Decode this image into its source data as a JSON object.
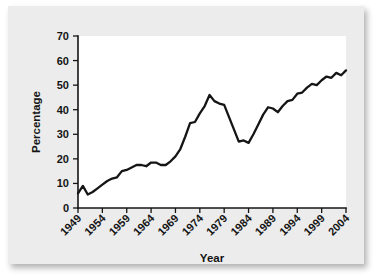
{
  "chart_data": {
    "type": "line",
    "title": "",
    "xlabel": "Year",
    "ylabel": "Percentage",
    "xlim": [
      1949,
      2004
    ],
    "ylim": [
      0,
      70
    ],
    "grid": false,
    "legend": null,
    "ytick_labels": [
      "0",
      "10",
      "20",
      "30",
      "40",
      "50",
      "60",
      "70"
    ],
    "ytick_values": [
      0,
      10,
      20,
      30,
      40,
      50,
      60,
      70
    ],
    "xtick_labels": [
      "1949",
      "1954",
      "1959",
      "1964",
      "1969",
      "1974",
      "1979",
      "1984",
      "1989",
      "1994",
      "1999",
      "2004"
    ],
    "xtick_values": [
      1949,
      1954,
      1959,
      1964,
      1969,
      1974,
      1979,
      1984,
      1989,
      1994,
      1999,
      2004
    ],
    "xtick_rotation": 45,
    "series": [
      {
        "name": "Percentage",
        "color": "#151515",
        "x": [
          1949,
          1950,
          1951,
          1952,
          1953,
          1954,
          1955,
          1956,
          1957,
          1958,
          1959,
          1960,
          1961,
          1962,
          1963,
          1964,
          1965,
          1966,
          1967,
          1968,
          1969,
          1970,
          1971,
          1972,
          1973,
          1974,
          1975,
          1976,
          1977,
          1978,
          1979,
          1980,
          1981,
          1982,
          1983,
          1984,
          1985,
          1986,
          1987,
          1988,
          1989,
          1990,
          1991,
          1992,
          1993,
          1994,
          1995,
          1996,
          1997,
          1998,
          1999,
          2000,
          2001,
          2002,
          2003,
          2004
        ],
        "y": [
          6.0,
          9.0,
          5.5,
          6.5,
          8.0,
          9.5,
          11.0,
          12.0,
          12.5,
          15.0,
          15.5,
          16.5,
          17.5,
          17.5,
          17.0,
          18.5,
          18.5,
          17.5,
          17.5,
          19.0,
          21.0,
          24.0,
          29.0,
          34.5,
          35.0,
          38.5,
          41.5,
          46.0,
          43.5,
          42.5,
          42.0,
          37.0,
          32.0,
          27.0,
          27.5,
          26.5,
          30.0,
          34.0,
          38.0,
          41.0,
          40.5,
          39.0,
          41.5,
          43.5,
          44.0,
          46.5,
          47.0,
          49.0,
          50.5,
          50.0,
          52.0,
          53.5,
          53.0,
          55.0,
          54.0,
          56.0
        ]
      }
    ]
  },
  "figure": {
    "background_color": "#ececec",
    "plot_background_color": "#ffffff",
    "axis_color": "#151515"
  }
}
